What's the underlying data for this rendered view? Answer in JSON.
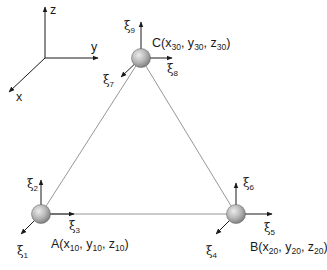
{
  "axes": {
    "z_label": "z",
    "y_label": "y",
    "x_label": "x"
  },
  "nodes": [
    {
      "id": "A",
      "label_prefix": "A(x",
      "coords": [
        "10",
        "10",
        "10"
      ],
      "sep_y": ", y",
      "sep_z": ", z",
      "close": ")",
      "dofs": [
        {
          "sym": "ξ",
          "idx": "1",
          "dir": "x"
        },
        {
          "sym": "ξ",
          "idx": "2",
          "dir": "z"
        },
        {
          "sym": "ξ",
          "idx": "3",
          "dir": "y"
        }
      ]
    },
    {
      "id": "B",
      "label_prefix": "B(x",
      "coords": [
        "20",
        "20",
        "20"
      ],
      "sep_y": ", y",
      "sep_z": ", z",
      "close": ")",
      "dofs": [
        {
          "sym": "ξ",
          "idx": "4",
          "dir": "x"
        },
        {
          "sym": "ξ",
          "idx": "5",
          "dir": "y"
        },
        {
          "sym": "ξ",
          "idx": "6",
          "dir": "z"
        }
      ]
    },
    {
      "id": "C",
      "label_prefix": "C(x",
      "coords": [
        "30",
        "30",
        "30"
      ],
      "sep_y": ", y",
      "sep_z": ", z",
      "close": ")",
      "dofs": [
        {
          "sym": "ξ",
          "idx": "7",
          "dir": "x"
        },
        {
          "sym": "ξ",
          "idx": "8",
          "dir": "y"
        },
        {
          "sym": "ξ",
          "idx": "9",
          "dir": "z"
        }
      ]
    }
  ],
  "colors": {
    "ink": "#1a1a1a",
    "edge": "#8a8a8a",
    "node_light": "#e6e6e6",
    "node_dark": "#8c8c8c"
  }
}
